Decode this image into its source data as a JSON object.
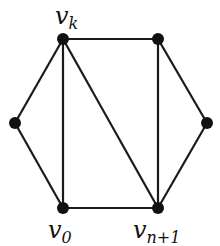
{
  "graph": {
    "nodes": [
      {
        "id": "vk",
        "x": 63,
        "y": 39,
        "label": "v",
        "sub": "k"
      },
      {
        "id": "tr",
        "x": 158,
        "y": 39,
        "label": "",
        "sub": ""
      },
      {
        "id": "l",
        "x": 15,
        "y": 123,
        "label": "",
        "sub": ""
      },
      {
        "id": "r",
        "x": 207,
        "y": 123,
        "label": "",
        "sub": ""
      },
      {
        "id": "v0",
        "x": 63,
        "y": 208,
        "label": "v",
        "sub": "0"
      },
      {
        "id": "vn1",
        "x": 158,
        "y": 208,
        "label": "v",
        "sub": "n+1"
      }
    ],
    "edges": [
      [
        "vk",
        "tr"
      ],
      [
        "vk",
        "l"
      ],
      [
        "vk",
        "v0"
      ],
      [
        "vk",
        "vn1"
      ],
      [
        "tr",
        "vn1"
      ],
      [
        "tr",
        "r"
      ],
      [
        "l",
        "v0"
      ],
      [
        "v0",
        "vn1"
      ],
      [
        "r",
        "vn1"
      ]
    ]
  },
  "labels": {
    "vk": {
      "main": "v",
      "sub": "k"
    },
    "v0": {
      "main": "v",
      "sub": "0"
    },
    "vn1": {
      "main": "v",
      "sub": "n+1"
    }
  }
}
